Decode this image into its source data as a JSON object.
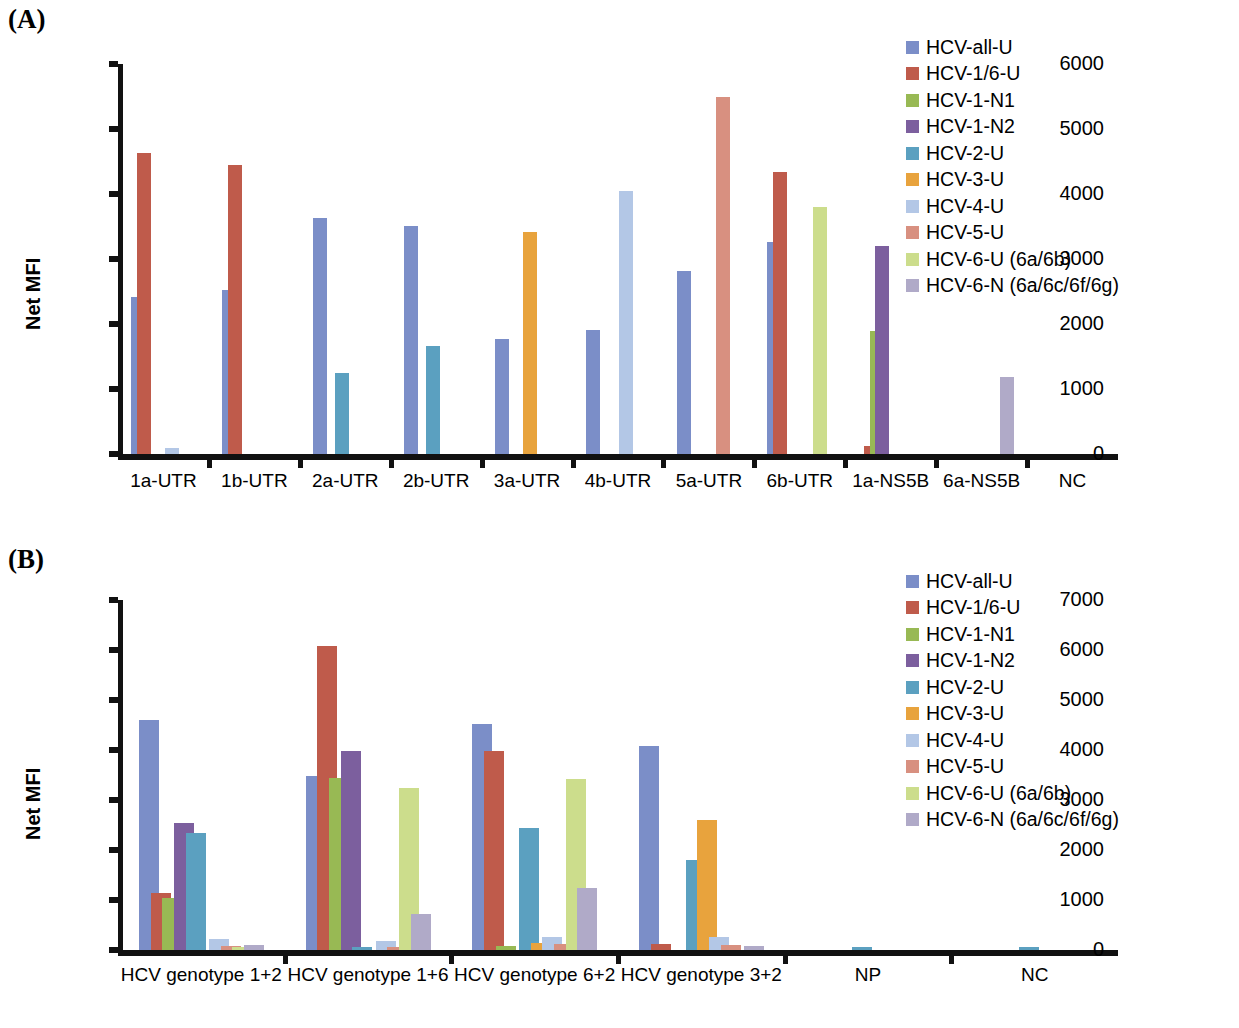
{
  "figure": {
    "panel_a_letter": "(A)",
    "panel_b_letter": "(B)",
    "y_axis_title": "Net MFI"
  },
  "series_defs": [
    {
      "name": "HCV-all-U",
      "color": "#7b8ec8"
    },
    {
      "name": "HCV-1/6-U",
      "color": "#bf5b4b"
    },
    {
      "name": "HCV-1-N1",
      "color": "#98b954"
    },
    {
      "name": "HCV-1-N2",
      "color": "#7c5f9e"
    },
    {
      "name": "HCV-2-U",
      "color": "#5ba0c0"
    },
    {
      "name": "HCV-3-U",
      "color": "#e8a33d"
    },
    {
      "name": "HCV-4-U",
      "color": "#b3c7e6"
    },
    {
      "name": "HCV-5-U",
      "color": "#d89080"
    },
    {
      "name": "HCV-6-U (6a/6b)",
      "color": "#ccdd8c"
    },
    {
      "name": "HCV-6-N (6a/6c/6f/6g)",
      "color": "#b0aac8"
    }
  ],
  "chart_data": [
    {
      "id": "panel-a",
      "type": "bar",
      "title": "(A)",
      "xlabel": "",
      "ylabel": "Net MFI",
      "ylim": [
        0,
        6000
      ],
      "yticks": [
        0,
        1000,
        2000,
        3000,
        4000,
        5000,
        6000
      ],
      "ytick_labels": [
        "0",
        "1000",
        "2000",
        "3000",
        "4000",
        "5000",
        "6000"
      ],
      "grid": false,
      "legend_position": "right",
      "categories": [
        "1a-UTR",
        "1b-UTR",
        "2a-UTR",
        "2b-UTR",
        "3a-UTR",
        "4b-UTR",
        "5a-UTR",
        "6b-UTR",
        "1a-NS5B",
        "6a-NS5B",
        "NC"
      ],
      "series": [
        {
          "name": "HCV-all-U",
          "values": [
            2410,
            2530,
            3630,
            3510,
            1770,
            1910,
            2820,
            3260,
            0,
            0,
            0
          ]
        },
        {
          "name": "HCV-1/6-U",
          "values": [
            4630,
            4450,
            0,
            0,
            0,
            0,
            0,
            4340,
            120,
            0,
            0
          ]
        },
        {
          "name": "HCV-1-N1",
          "values": [
            0,
            0,
            0,
            0,
            0,
            0,
            0,
            0,
            1890,
            0,
            0
          ]
        },
        {
          "name": "HCV-1-N2",
          "values": [
            0,
            0,
            0,
            0,
            0,
            0,
            0,
            0,
            3200,
            0,
            0
          ]
        },
        {
          "name": "HCV-2-U",
          "values": [
            0,
            0,
            1250,
            1660,
            0,
            0,
            0,
            0,
            0,
            0,
            0
          ]
        },
        {
          "name": "HCV-3-U",
          "values": [
            0,
            0,
            0,
            0,
            3410,
            0,
            0,
            0,
            0,
            0,
            0
          ]
        },
        {
          "name": "HCV-4-U",
          "values": [
            100,
            0,
            0,
            0,
            0,
            4040,
            0,
            0,
            0,
            0,
            0
          ]
        },
        {
          "name": "HCV-5-U",
          "values": [
            0,
            0,
            0,
            0,
            0,
            0,
            5500,
            0,
            0,
            0,
            0
          ]
        },
        {
          "name": "HCV-6-U (6a/6b)",
          "values": [
            0,
            0,
            0,
            0,
            0,
            0,
            0,
            3800,
            0,
            0,
            0
          ]
        },
        {
          "name": "HCV-6-N (6a/6c/6f/6g)",
          "values": [
            0,
            0,
            0,
            0,
            0,
            0,
            0,
            0,
            0,
            1190,
            0
          ]
        }
      ]
    },
    {
      "id": "panel-b",
      "type": "bar",
      "title": "(B)",
      "xlabel": "",
      "ylabel": "Net MFI",
      "ylim": [
        0,
        7000
      ],
      "yticks": [
        0,
        1000,
        2000,
        3000,
        4000,
        5000,
        6000,
        7000
      ],
      "ytick_labels": [
        "0",
        "1000",
        "2000",
        "3000",
        "4000",
        "5000",
        "6000",
        "7000"
      ],
      "grid": false,
      "legend_position": "right",
      "categories": [
        "HCV genotype 1+2",
        "HCV genotype 1+6",
        "HCV genotype 6+2",
        "HCV genotype 3+2",
        "NP",
        "NC"
      ],
      "series": [
        {
          "name": "HCV-all-U",
          "values": [
            4600,
            3480,
            4520,
            4090,
            0,
            0
          ]
        },
        {
          "name": "HCV-1/6-U",
          "values": [
            1140,
            6080,
            3990,
            120,
            0,
            0
          ]
        },
        {
          "name": "HCV-1-N1",
          "values": [
            1050,
            3440,
            80,
            0,
            0,
            0
          ]
        },
        {
          "name": "HCV-1-N2",
          "values": [
            2550,
            3990,
            0,
            0,
            0,
            0
          ]
        },
        {
          "name": "HCV-2-U",
          "values": [
            2340,
            60,
            2440,
            1800,
            60,
            60
          ]
        },
        {
          "name": "HCV-3-U",
          "values": [
            0,
            0,
            150,
            2600,
            0,
            0
          ]
        },
        {
          "name": "HCV-4-U",
          "values": [
            230,
            180,
            270,
            270,
            0,
            0
          ]
        },
        {
          "name": "HCV-5-U",
          "values": [
            90,
            70,
            130,
            110,
            0,
            0
          ]
        },
        {
          "name": "HCV-6-U (6a/6b)",
          "values": [
            60,
            3250,
            3420,
            0,
            0,
            0
          ]
        },
        {
          "name": "HCV-6-N (6a/6c/6f/6g)",
          "values": [
            110,
            730,
            1240,
            90,
            0,
            0
          ]
        }
      ]
    }
  ]
}
